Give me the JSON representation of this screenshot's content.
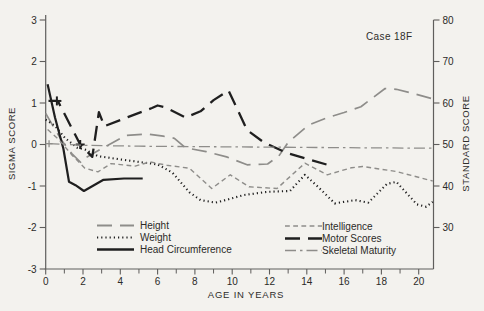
{
  "chart_data": {
    "type": "line",
    "annotation": "Case 18F",
    "xlabel": "AGE IN YEARS",
    "ylabel_left": "SIGMA SCORE",
    "ylabel_right": "STANDARD SCORE",
    "xlim": [
      0,
      20.8
    ],
    "ylim_sigma": [
      -3,
      3
    ],
    "ylim_standard": [
      20,
      80
    ],
    "grid": "off",
    "x_ticks_major": [
      0,
      2,
      4,
      6,
      8,
      10,
      12,
      14,
      16,
      18,
      20
    ],
    "x_ticks_minor": [
      1,
      3,
      5,
      7,
      9,
      11,
      13,
      15,
      17,
      19
    ],
    "y_ticks_sigma": [
      3,
      2,
      1,
      0,
      -1,
      -2,
      -3
    ],
    "y_ticks_sigma_labels": [
      "3",
      "2",
      "1",
      "0",
      "-1",
      "-2",
      "-3"
    ],
    "y_ticks_standard": [
      80,
      70,
      60,
      50,
      40,
      30
    ],
    "y_ticks_standard_labels": [
      "80",
      "70",
      "60",
      "50",
      "40",
      "30"
    ],
    "colors": {
      "black": "#1f1f1f",
      "gray": "#8e8d8a",
      "axis": "#5f5e5c",
      "text": "#2b2a28"
    },
    "legend_left_keys": [
      "height",
      "weight",
      "head_circumference"
    ],
    "legend_right_keys": [
      "intelligence",
      "motor_scores",
      "skeletal_maturity"
    ],
    "series": [
      {
        "key": "height",
        "name": "Height",
        "color": "gray",
        "line_style": "long-dash",
        "width": 1.7,
        "points": [
          [
            0,
            0.75
          ],
          [
            0.45,
            0.4
          ],
          [
            0.9,
            0.07
          ],
          [
            1.4,
            -0.22
          ],
          [
            1.9,
            -0.44
          ],
          [
            2.1,
            -0.33
          ],
          [
            3.2,
            -0.05
          ],
          [
            4.3,
            0.22
          ],
          [
            5.5,
            0.25
          ],
          [
            6.3,
            0.2
          ],
          [
            6.9,
            0.15
          ],
          [
            7.5,
            -0.08
          ],
          [
            8.6,
            -0.17
          ],
          [
            9.7,
            -0.3
          ],
          [
            10.8,
            -0.49
          ],
          [
            11.9,
            -0.47
          ],
          [
            12.5,
            -0.28
          ],
          [
            13,
            0.05
          ],
          [
            14.1,
            0.47
          ],
          [
            15,
            0.63
          ],
          [
            16,
            0.77
          ],
          [
            16.9,
            0.91
          ],
          [
            18.2,
            1.35
          ],
          [
            18.8,
            1.33
          ],
          [
            19.6,
            1.24
          ],
          [
            20.75,
            1.1
          ]
        ]
      },
      {
        "key": "weight",
        "name": "Weight",
        "color": "black",
        "line_style": "dotted",
        "width": 2.1,
        "points": [
          [
            0,
            0.6
          ],
          [
            0.5,
            0.45
          ],
          [
            1.05,
            0.15
          ],
          [
            1.7,
            -0.08
          ],
          [
            2.1,
            -0.12
          ],
          [
            2.8,
            -0.28
          ],
          [
            4,
            -0.36
          ],
          [
            5,
            -0.42
          ],
          [
            6,
            -0.48
          ],
          [
            6.8,
            -0.68
          ],
          [
            7.7,
            -1.15
          ],
          [
            8.3,
            -1.34
          ],
          [
            9.1,
            -1.4
          ],
          [
            9.8,
            -1.32
          ],
          [
            10.6,
            -1.22
          ],
          [
            11.9,
            -1.14
          ],
          [
            13.1,
            -1.12
          ],
          [
            13.9,
            -0.73
          ],
          [
            14.6,
            -1.02
          ],
          [
            15.5,
            -1.42
          ],
          [
            16.6,
            -1.34
          ],
          [
            17.3,
            -1.4
          ],
          [
            18.3,
            -0.95
          ],
          [
            18.8,
            -0.9
          ],
          [
            19.9,
            -1.44
          ],
          [
            20.4,
            -1.5
          ],
          [
            20.75,
            -1.38
          ]
        ]
      },
      {
        "key": "head_circumference",
        "name": "Head Circumference",
        "color": "black",
        "line_style": "solid",
        "width": 2.2,
        "points": [
          [
            0.1,
            1.45
          ],
          [
            0.5,
            0.65
          ],
          [
            0.95,
            -0.1
          ],
          [
            1.25,
            -0.9
          ],
          [
            1.6,
            -0.98
          ],
          [
            2.05,
            -1.12
          ],
          [
            3.1,
            -0.85
          ],
          [
            4.2,
            -0.82
          ],
          [
            5.2,
            -0.82
          ]
        ]
      },
      {
        "key": "intelligence",
        "name": "Intelligence",
        "color": "gray",
        "line_style": "short-dash",
        "width": 1.4,
        "points": [
          [
            0.1,
            0.36
          ],
          [
            0.7,
            0.12
          ],
          [
            1.4,
            -0.25
          ],
          [
            2.1,
            -0.57
          ],
          [
            2.8,
            -0.66
          ],
          [
            3.5,
            -0.46
          ],
          [
            4.8,
            -0.52
          ],
          [
            5.6,
            -0.42
          ],
          [
            6.5,
            -0.5
          ],
          [
            7.7,
            -0.57
          ],
          [
            8.9,
            -1.06
          ],
          [
            9.9,
            -0.73
          ],
          [
            10.9,
            -1.02
          ],
          [
            12.4,
            -1.06
          ],
          [
            13.9,
            -0.45
          ],
          [
            15.1,
            -0.73
          ],
          [
            16.4,
            -0.56
          ],
          [
            17,
            -0.53
          ],
          [
            18.8,
            -0.65
          ],
          [
            20.75,
            -0.88
          ]
        ]
      },
      {
        "key": "motor_scores",
        "name": "Motor Scores",
        "color": "black",
        "line_style": "long-dash",
        "width": 2.3,
        "points": [
          [
            0.15,
            1.05
          ],
          [
            0.65,
            1.05
          ],
          [
            1.85,
            0
          ],
          [
            2.5,
            -0.3
          ],
          [
            2.85,
            0.78
          ],
          [
            3.15,
            0.44
          ],
          [
            4.4,
            0.66
          ],
          [
            5.7,
            0.88
          ],
          [
            6,
            0.94
          ],
          [
            6.4,
            0.9
          ],
          [
            7.5,
            0.65
          ],
          [
            8.3,
            0.8
          ],
          [
            9,
            1.07
          ],
          [
            9.8,
            1.3
          ],
          [
            10.8,
            0.35
          ],
          [
            11.7,
            0.05
          ],
          [
            12.9,
            -0.2
          ],
          [
            15.2,
            -0.5
          ]
        ],
        "markers": [
          [
            0.6,
            1.05
          ],
          [
            1.85,
            0
          ]
        ]
      },
      {
        "key": "skeletal_maturity",
        "name": "Skeletal Maturity",
        "color": "gray",
        "line_style": "dash-dot",
        "width": 1.3,
        "points": [
          [
            0.15,
            0.02
          ],
          [
            2,
            -0.02
          ],
          [
            5,
            -0.04
          ],
          [
            8,
            -0.05
          ],
          [
            11,
            -0.06
          ],
          [
            14,
            -0.07
          ],
          [
            17,
            -0.08
          ],
          [
            20.75,
            -0.09
          ]
        ],
        "markers": [
          [
            0.18,
            0.02
          ]
        ]
      }
    ]
  }
}
